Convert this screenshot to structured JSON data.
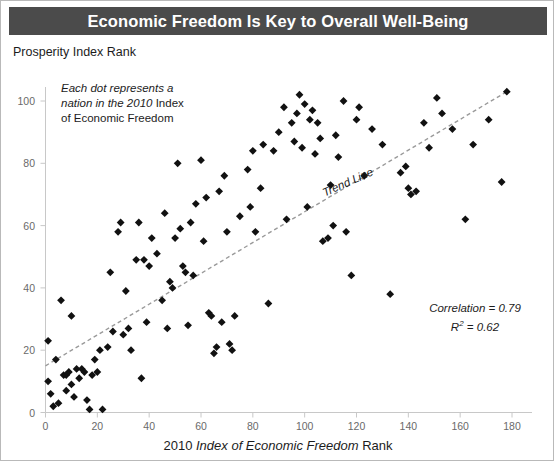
{
  "title": "Economic Freedom Is Key to Overall Well-Being",
  "annotation": {
    "line1_italic": "Each dot represents a",
    "line2_italic": "nation in the 2010 ",
    "line2_roman": "Index",
    "line3_roman": "of Economic Freedom"
  },
  "stats": {
    "correlation": "Correlation = 0.79",
    "r_squared_prefix": "R",
    "r_squared_sup": "2",
    "r_squared_value": " = 0.62"
  },
  "trend_label": "Trend Line",
  "axes": {
    "ylabel": "Prosperity Index Rank",
    "xlabel_pre": "2010 ",
    "xlabel_italic": "Index of Economic Freedom",
    "xlabel_post": " Rank"
  },
  "chart_data": {
    "type": "scatter",
    "title": "Economic Freedom Is Key to Overall Well-Being",
    "xlabel": "2010 Index of Economic Freedom Rank",
    "ylabel": "Prosperity Index Rank",
    "xlim": [
      0,
      186
    ],
    "ylim": [
      0,
      110
    ],
    "xticks": [
      0,
      20,
      40,
      60,
      80,
      100,
      120,
      140,
      160,
      180
    ],
    "yticks": [
      0,
      20,
      40,
      60,
      80,
      100
    ],
    "grid": false,
    "legend": null,
    "marker": "diamond",
    "marker_color": "#111111",
    "correlation": 0.79,
    "r_squared": 0.62,
    "trendline": {
      "style": "dashed",
      "color": "#9a9a9a",
      "x0": 0,
      "y0": 15,
      "x1": 178,
      "y1": 103,
      "label": "Trend Line"
    },
    "points": [
      [
        1,
        23
      ],
      [
        1,
        10
      ],
      [
        2,
        6
      ],
      [
        3,
        2
      ],
      [
        4,
        17
      ],
      [
        5,
        3
      ],
      [
        6,
        36
      ],
      [
        7,
        12
      ],
      [
        8,
        7
      ],
      [
        8,
        12
      ],
      [
        9,
        13
      ],
      [
        10,
        9
      ],
      [
        10,
        31
      ],
      [
        11,
        5
      ],
      [
        12,
        14
      ],
      [
        13,
        11
      ],
      [
        14,
        14
      ],
      [
        15,
        13
      ],
      [
        16,
        4
      ],
      [
        17,
        1
      ],
      [
        18,
        12
      ],
      [
        19,
        17
      ],
      [
        20,
        13
      ],
      [
        21,
        20
      ],
      [
        22,
        1
      ],
      [
        24,
        21
      ],
      [
        25,
        45
      ],
      [
        26,
        26
      ],
      [
        28,
        58
      ],
      [
        29,
        61
      ],
      [
        30,
        25
      ],
      [
        31,
        39
      ],
      [
        32,
        27
      ],
      [
        33,
        20
      ],
      [
        35,
        49
      ],
      [
        36,
        61
      ],
      [
        37,
        11
      ],
      [
        38,
        49
      ],
      [
        39,
        29
      ],
      [
        40,
        47
      ],
      [
        41,
        56
      ],
      [
        43,
        51
      ],
      [
        45,
        36
      ],
      [
        46,
        64
      ],
      [
        47,
        27
      ],
      [
        48,
        42
      ],
      [
        49,
        40
      ],
      [
        50,
        56
      ],
      [
        51,
        80
      ],
      [
        52,
        59
      ],
      [
        53,
        47
      ],
      [
        54,
        45
      ],
      [
        55,
        28
      ],
      [
        56,
        61
      ],
      [
        57,
        44
      ],
      [
        58,
        67
      ],
      [
        60,
        81
      ],
      [
        61,
        55
      ],
      [
        62,
        69
      ],
      [
        63,
        32
      ],
      [
        64,
        31
      ],
      [
        65,
        19
      ],
      [
        66,
        21
      ],
      [
        67,
        71
      ],
      [
        68,
        29
      ],
      [
        69,
        76
      ],
      [
        70,
        58
      ],
      [
        71,
        22
      ],
      [
        72,
        20
      ],
      [
        73,
        31
      ],
      [
        75,
        63
      ],
      [
        78,
        78
      ],
      [
        79,
        66
      ],
      [
        80,
        84
      ],
      [
        81,
        58
      ],
      [
        83,
        72
      ],
      [
        84,
        86
      ],
      [
        86,
        35
      ],
      [
        88,
        84
      ],
      [
        90,
        90
      ],
      [
        92,
        98
      ],
      [
        93,
        62
      ],
      [
        95,
        93
      ],
      [
        96,
        87
      ],
      [
        97,
        96
      ],
      [
        98,
        102
      ],
      [
        99,
        85
      ],
      [
        100,
        99
      ],
      [
        101,
        66
      ],
      [
        102,
        94
      ],
      [
        103,
        97
      ],
      [
        104,
        83
      ],
      [
        105,
        93
      ],
      [
        106,
        88
      ],
      [
        107,
        55
      ],
      [
        109,
        56
      ],
      [
        110,
        73
      ],
      [
        111,
        60
      ],
      [
        112,
        89
      ],
      [
        113,
        82
      ],
      [
        115,
        100
      ],
      [
        116,
        58
      ],
      [
        118,
        44
      ],
      [
        120,
        94
      ],
      [
        121,
        98
      ],
      [
        123,
        76
      ],
      [
        126,
        91
      ],
      [
        130,
        86
      ],
      [
        133,
        38
      ],
      [
        137,
        77
      ],
      [
        139,
        79
      ],
      [
        140,
        72
      ],
      [
        141,
        70
      ],
      [
        143,
        71
      ],
      [
        146,
        93
      ],
      [
        148,
        85
      ],
      [
        151,
        101
      ],
      [
        153,
        96
      ],
      [
        157,
        91
      ],
      [
        162,
        62
      ],
      [
        165,
        86
      ],
      [
        171,
        94
      ],
      [
        176,
        74
      ],
      [
        178,
        103
      ]
    ]
  }
}
